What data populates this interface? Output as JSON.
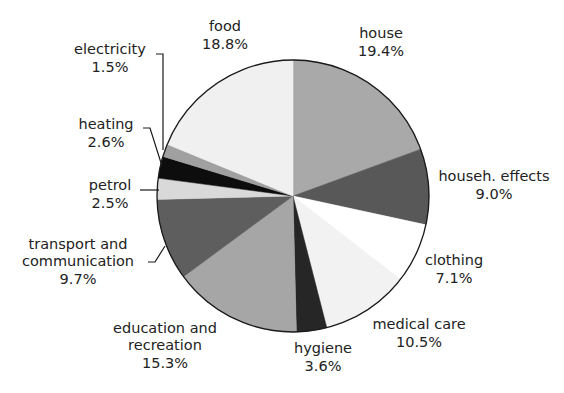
{
  "chart_data": {
    "type": "pie",
    "title": "",
    "start_angle_deg": -90,
    "direction": "clockwise",
    "center": [
      293,
      196
    ],
    "radius": 136,
    "slices": [
      {
        "label": "house",
        "value": 19.4,
        "display": "19.4%",
        "color": "#a9a9a9"
      },
      {
        "label": "househ. effects",
        "value": 9.0,
        "display": "9.0%",
        "color": "#585858"
      },
      {
        "label": "clothing",
        "value": 7.1,
        "display": "7.1%",
        "color": "#ffffff"
      },
      {
        "label": "medical care",
        "value": 10.5,
        "display": "10.5%",
        "color": "#f2f2f2"
      },
      {
        "label": "hygiene",
        "value": 3.6,
        "display": "3.6%",
        "color": "#262626"
      },
      {
        "label": "education and recreation",
        "value": 15.3,
        "display": "15.3%",
        "color": "#a6a6a6"
      },
      {
        "label": "transport and communication",
        "value": 9.7,
        "display": "9.7%",
        "color": "#5e5e5e"
      },
      {
        "label": "petrol",
        "value": 2.5,
        "display": "2.5%",
        "color": "#d9d9d9"
      },
      {
        "label": "heating",
        "value": 2.6,
        "display": "2.6%",
        "color": "#0d0d0d"
      },
      {
        "label": "electricity",
        "value": 1.5,
        "display": "1.5%",
        "color": "#a0a0a0"
      },
      {
        "label": "food",
        "value": 18.8,
        "display": "18.8%",
        "color": "#f0f0f0"
      }
    ],
    "unit": "%",
    "legend": "none (direct labels)"
  },
  "labels": {
    "house": {
      "name": "house",
      "pct": "19.4%"
    },
    "househ_effects": {
      "name": "househ. effects",
      "pct": "9.0%"
    },
    "clothing": {
      "name": "clothing",
      "pct": "7.1%"
    },
    "medical_care": {
      "name": "medical care",
      "pct": "10.5%"
    },
    "hygiene": {
      "name": "hygiene",
      "pct": "3.6%"
    },
    "education": {
      "line1": "education and",
      "line2": "recreation",
      "pct": "15.3%"
    },
    "transport": {
      "line1": "transport and",
      "line2": "communication",
      "pct": "9.7%"
    },
    "petrol": {
      "name": "petrol",
      "pct": "2.5%"
    },
    "heating": {
      "name": "heating",
      "pct": "2.6%"
    },
    "electricity": {
      "name": "electricity",
      "pct": "1.5%"
    },
    "food": {
      "name": "food",
      "pct": "18.8%"
    }
  }
}
